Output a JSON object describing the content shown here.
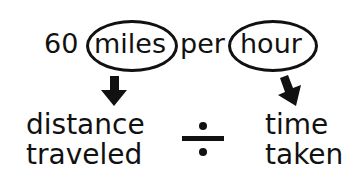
{
  "phrase": {
    "number": "60",
    "unit_top": "miles",
    "connector": "per",
    "unit_bottom": "hour"
  },
  "left_meaning": {
    "line1": "distance",
    "line2": "traveled"
  },
  "operator": "÷",
  "right_meaning": {
    "line1": "time",
    "line2": "taken"
  },
  "colors": {
    "ink": "#111111",
    "background": "#ffffff"
  }
}
